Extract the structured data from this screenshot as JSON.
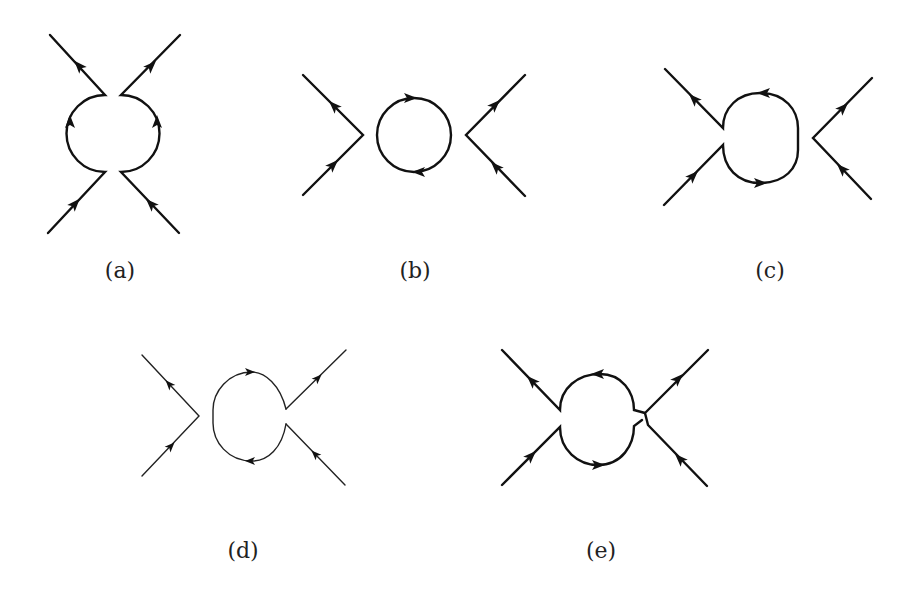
{
  "figure": {
    "panels": [
      {
        "id": "a",
        "label": "(a)",
        "description": "Two vertices joined by a loop; external lines top and bottom, loop arcs left and right"
      },
      {
        "id": "b",
        "label": "(b)",
        "description": "Disconnected vacuum bubble between two four-point vertices"
      },
      {
        "id": "c",
        "label": "(c)",
        "description": "Tadpole-like loop attached to left vertex, separate right vertex"
      },
      {
        "id": "d",
        "label": "(d)",
        "description": "Loop attached to right vertex, separate left vertex (thin lines)"
      },
      {
        "id": "e",
        "label": "(e)",
        "description": "Loop connecting left vertex with crossing right lines"
      }
    ],
    "colors": {
      "line": "#111111",
      "background": "#ffffff"
    }
  }
}
